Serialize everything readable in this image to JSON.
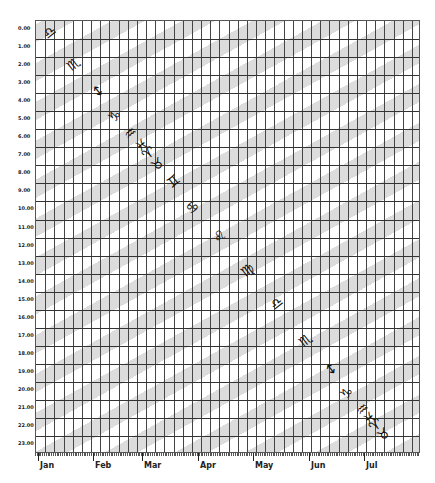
{
  "chart_data": {
    "type": "heatmap",
    "title": "",
    "xlabel": "",
    "ylabel": "",
    "y_ticks": [
      "0.00",
      "1.00",
      "2.00",
      "3.00",
      "4.00",
      "5.00",
      "6.00",
      "7.00",
      "8.00",
      "9.00",
      "10.00",
      "11.00",
      "12.00",
      "13.00",
      "14.00",
      "15.00",
      "16.00",
      "17.00",
      "18.00",
      "19.00",
      "20.00",
      "21.00",
      "22.00",
      "23.00"
    ],
    "x_months": [
      "Jan",
      "Feb",
      "Mar",
      "Apr",
      "May",
      "Jun",
      "Jul"
    ],
    "x_month_positions_px": [
      3,
      58,
      107,
      163,
      218,
      274,
      329
    ],
    "columns": 42,
    "rows": 24,
    "grid": true,
    "legend": null,
    "glyphs": [
      {
        "symbol": "♎",
        "name": "libra",
        "x": 14,
        "y": 11
      },
      {
        "symbol": "♏",
        "name": "scorpio",
        "x": 38,
        "y": 43
      },
      {
        "symbol": "↕",
        "name": "sagittarius",
        "x": 63,
        "y": 70
      },
      {
        "symbol": "♑",
        "name": "capricorn",
        "x": 79,
        "y": 95
      },
      {
        "symbol": "♒",
        "name": "aquarius",
        "x": 95,
        "y": 112
      },
      {
        "symbol": "♓",
        "name": "pisces",
        "x": 106,
        "y": 124
      },
      {
        "symbol": "♈",
        "name": "aries",
        "x": 113,
        "y": 132
      },
      {
        "symbol": "♉",
        "name": "taurus",
        "x": 122,
        "y": 143
      },
      {
        "symbol": "♊",
        "name": "gemini",
        "x": 138,
        "y": 160
      },
      {
        "symbol": "♋",
        "name": "cancer",
        "x": 157,
        "y": 186
      },
      {
        "symbol": "♌",
        "name": "leo",
        "x": 184,
        "y": 215
      },
      {
        "symbol": "♍",
        "name": "virgo",
        "x": 212,
        "y": 249
      },
      {
        "symbol": "♎",
        "name": "libra",
        "x": 241,
        "y": 282
      },
      {
        "symbol": "♏",
        "name": "scorpio",
        "x": 270,
        "y": 319
      },
      {
        "symbol": "↕",
        "name": "sagittarius",
        "x": 296,
        "y": 348
      },
      {
        "symbol": "♑",
        "name": "capricorn",
        "x": 311,
        "y": 372
      },
      {
        "symbol": "♒",
        "name": "aquarius",
        "x": 327,
        "y": 388
      },
      {
        "symbol": "♓",
        "name": "pisces",
        "x": 334,
        "y": 397
      },
      {
        "symbol": "♈",
        "name": "aries",
        "x": 340,
        "y": 404
      },
      {
        "symbol": "♉",
        "name": "taurus",
        "x": 348,
        "y": 413
      }
    ],
    "colors": {
      "band": "#dcdcdc",
      "background": "#ffffff",
      "grid": "#333333"
    }
  }
}
